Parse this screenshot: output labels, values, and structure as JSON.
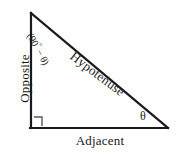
{
  "figure": {
    "kind": "right-triangle-trigonometry-diagram",
    "background_color": "#ffffff",
    "stroke_color": "#1a1a1a",
    "marker_color": "#555555"
  },
  "geometry": {
    "apex_vertex": "31,13",
    "right_angle_vertex": "31,128",
    "theta_vertex": "168,128",
    "opposite_leg": "31,13 31,128",
    "adjacent_leg": "31,128 168,128",
    "hypotenuse": "31,13 168,128",
    "right_angle_marker": "31,117 42,117 42,128"
  },
  "labels": {
    "opposite": "Opposite",
    "adjacent": "Adjacent",
    "hypotenuse": "Hypotenuse",
    "complement_angle_open": "(90",
    "complement_angle_degree": "°",
    "complement_angle_rest": " − θ)",
    "theta": "θ",
    "watermark": ""
  }
}
